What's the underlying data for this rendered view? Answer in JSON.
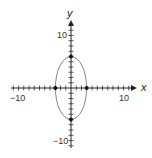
{
  "figure": {
    "x_axis_label": "x",
    "y_axis_label": "y",
    "x_tick_labels": {
      "neg": "−10",
      "pos": "10"
    },
    "y_tick_labels": {
      "neg": "−10",
      "pos": "10"
    },
    "curve": "ellipse",
    "equation_implied": "x^2/9 + y^2/36 = 1",
    "colors": {
      "axes": "#222222",
      "curve": "#888888",
      "points": "#111111"
    }
  },
  "chart_data": {
    "type": "scatter",
    "title": "",
    "xlabel": "x",
    "ylabel": "y",
    "xlim": [
      -12,
      12
    ],
    "ylim": [
      -12,
      12
    ],
    "grid": false,
    "ticks": {
      "x": [
        -10,
        10
      ],
      "y": [
        -10,
        10
      ],
      "tick_spacing": 1
    },
    "series": [
      {
        "name": "ellipse",
        "kind": "curve",
        "center": [
          0,
          0
        ],
        "semi_axis_x": 3,
        "semi_axis_y": 6
      },
      {
        "name": "vertices",
        "kind": "points",
        "points": [
          [
            0,
            6
          ],
          [
            0,
            -6
          ],
          [
            -3,
            0
          ],
          [
            3,
            0
          ]
        ]
      }
    ]
  }
}
